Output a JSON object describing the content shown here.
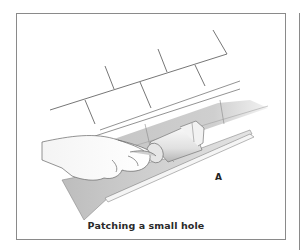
{
  "figure": {
    "label": "A",
    "caption": "Patching a small hole",
    "colors": {
      "frame": "#8a8a8a",
      "line": "#555555",
      "shade_dark": "#b8b8b8",
      "shade_light": "#dedede",
      "text": "#222222"
    }
  }
}
